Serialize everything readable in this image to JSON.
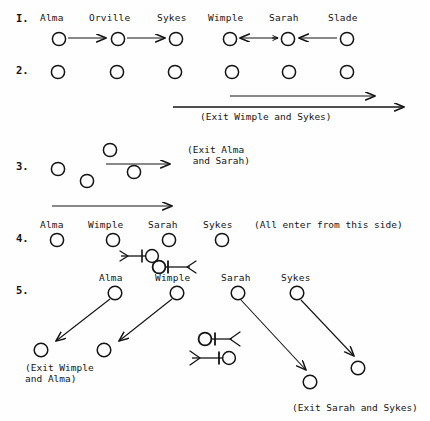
{
  "figure": {
    "type": "stage-blocking-diagram",
    "ink_color": "#141414",
    "paper_color": "#fefefe",
    "characters": [
      "Alma",
      "Orville",
      "Sykes",
      "Wimple",
      "Sarah",
      "Slade"
    ]
  },
  "steps": [
    {
      "number": "I.",
      "labels": [
        "Alma",
        "Orville",
        "Sykes",
        "Wimple",
        "Sarah",
        "Slade"
      ],
      "note": ""
    },
    {
      "number": "2.",
      "labels": [],
      "note": "(Exit Wimple and Sykes)"
    },
    {
      "number": "3.",
      "labels": [],
      "note": "(Exit Alma\n and Sarah)"
    },
    {
      "number": "4.",
      "labels": [
        "Alma",
        "Wimple",
        "Sarah",
        "Sykes"
      ],
      "note": "(All enter from this side)"
    },
    {
      "number": "5.",
      "labels": [
        "Alma",
        "Wimple",
        "Sarah",
        "Sykes"
      ],
      "note_left": "(Exit Wimple\nand Alma)",
      "note_right": "(Exit Sarah and Sykes)"
    }
  ],
  "row1": {
    "number": "I.",
    "name_alma": "Alma",
    "name_orville": "Orville",
    "name_sykes": "Sykes",
    "name_wimple": "Wimple",
    "name_sarah": "Sarah",
    "name_slade": "Slade"
  },
  "row2": {
    "number": "2.",
    "exit_note": "(Exit Wimple and Sykes)"
  },
  "row3": {
    "number": "3.",
    "exit_note_line1": "(Exit Alma",
    "exit_note_line2": " and Sarah)"
  },
  "row4": {
    "number": "4.",
    "name_alma": "Alma",
    "name_wimple": "Wimple",
    "name_sarah": "Sarah",
    "name_sykes": "Sykes",
    "enter_note": "(All enter from this side)"
  },
  "row5": {
    "number": "5.",
    "name_alma": "Alma",
    "name_wimple": "Wimple",
    "name_sarah": "Sarah",
    "name_sykes": "Sykes",
    "exit_note_left_line1": "(Exit Wimple",
    "exit_note_left_line2": "and Alma)",
    "exit_note_right": "(Exit Sarah and Sykes)"
  }
}
